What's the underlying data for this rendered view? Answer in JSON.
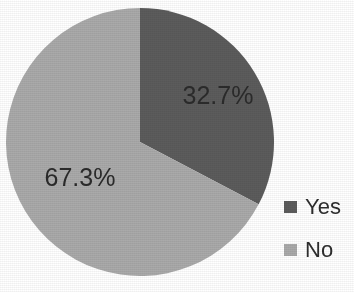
{
  "chart_data": {
    "type": "pie",
    "title": "",
    "subtitle": "",
    "xlabel": "",
    "ylabel": "",
    "grid": false,
    "legend_position": "right",
    "categories": [
      "Yes",
      "No"
    ],
    "values": [
      32.7,
      67.3
    ],
    "value_unit": "%",
    "start_angle_deg": 0,
    "direction": "clockwise",
    "slices": [
      {
        "label": "Yes",
        "value": 32.7,
        "data_label": "32.7%",
        "color": "#5c5c5c",
        "start_angle_deg": 0,
        "end_angle_deg": 117.72
      },
      {
        "label": "No",
        "value": 67.3,
        "data_label": "67.3%",
        "color": "#aaaaaa",
        "start_angle_deg": 117.72,
        "end_angle_deg": 360
      }
    ],
    "legend": [
      {
        "label": "Yes",
        "color": "#5c5c5c",
        "swatch_icon": "legend-square-icon"
      },
      {
        "label": "No",
        "color": "#aaaaaa",
        "swatch_icon": "legend-square-icon"
      }
    ],
    "data_labels": [
      "32.7%",
      "67.3%"
    ],
    "colors": {
      "yes": "#5c5c5c",
      "no": "#aaaaaa",
      "label_text": "#2b2b2b",
      "background": "#ffffff"
    }
  },
  "geometry": {
    "center_x": 140,
    "center_y": 142,
    "radius": 134,
    "label_yes_x": 218,
    "label_yes_y": 104,
    "label_no_x": 80,
    "label_no_y": 186
  }
}
